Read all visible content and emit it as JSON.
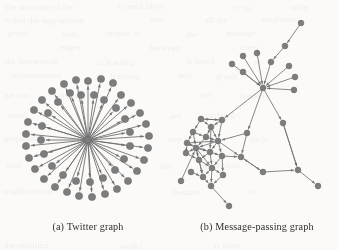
{
  "figure": {
    "kind": "two-panel-graph-figure",
    "background_color": "#fbfaf8",
    "node_color": "#7d7d7d",
    "node_stroke_color": "#6a6a6a",
    "edge_color": "#6f6f6f",
    "caption_color": "#2f2f2f",
    "panels": [
      {
        "id": "a",
        "caption": "(a) Twitter graph",
        "caption_center_x": 88,
        "caption_y": 221,
        "graph_type": "star",
        "directed": true,
        "node_radius": 3.6,
        "hub_radius": 3.2,
        "edge_width": 0.95,
        "arrowheads": true,
        "hub": {
          "id": "hub",
          "x": 88,
          "y": 140
        },
        "leaves": [
          {
            "id": "a1",
            "x": 88,
            "y": 81
          },
          {
            "id": "a2",
            "x": 101,
            "y": 79
          },
          {
            "id": "a3",
            "x": 113,
            "y": 83
          },
          {
            "id": "a4",
            "x": 76,
            "y": 80
          },
          {
            "id": "a5",
            "x": 64,
            "y": 84
          },
          {
            "id": "a6",
            "x": 52,
            "y": 91
          },
          {
            "id": "a7",
            "x": 42,
            "y": 100
          },
          {
            "id": "a8",
            "x": 34,
            "y": 110
          },
          {
            "id": "a9",
            "x": 28,
            "y": 122
          },
          {
            "id": "a10",
            "x": 26,
            "y": 134
          },
          {
            "id": "a11",
            "x": 26,
            "y": 146
          },
          {
            "id": "a12",
            "x": 29,
            "y": 158
          },
          {
            "id": "a13",
            "x": 35,
            "y": 169
          },
          {
            "id": "a14",
            "x": 44,
            "y": 179
          },
          {
            "id": "a15",
            "x": 55,
            "y": 187
          },
          {
            "id": "a16",
            "x": 67,
            "y": 192
          },
          {
            "id": "a17",
            "x": 79,
            "y": 196
          },
          {
            "id": "a18",
            "x": 92,
            "y": 197
          },
          {
            "id": "a19",
            "x": 105,
            "y": 194
          },
          {
            "id": "a20",
            "x": 117,
            "y": 189
          },
          {
            "id": "a21",
            "x": 128,
            "y": 181
          },
          {
            "id": "a22",
            "x": 137,
            "y": 171
          },
          {
            "id": "a23",
            "x": 144,
            "y": 160
          },
          {
            "id": "a24",
            "x": 148,
            "y": 148
          },
          {
            "id": "a25",
            "x": 149,
            "y": 136
          },
          {
            "id": "a26",
            "x": 146,
            "y": 124
          },
          {
            "id": "a27",
            "x": 140,
            "y": 113
          },
          {
            "id": "a28",
            "x": 131,
            "y": 103
          },
          {
            "id": "a29",
            "x": 121,
            "y": 95
          },
          {
            "id": "a30",
            "x": 70,
            "y": 93
          },
          {
            "id": "a31",
            "x": 58,
            "y": 102
          },
          {
            "id": "a32",
            "x": 48,
            "y": 113
          },
          {
            "id": "a33",
            "x": 42,
            "y": 126
          },
          {
            "id": "a34",
            "x": 41,
            "y": 140
          },
          {
            "id": "a35",
            "x": 44,
            "y": 154
          },
          {
            "id": "a36",
            "x": 52,
            "y": 166
          },
          {
            "id": "a37",
            "x": 63,
            "y": 175
          },
          {
            "id": "a38",
            "x": 76,
            "y": 181
          },
          {
            "id": "a39",
            "x": 90,
            "y": 182
          },
          {
            "id": "a40",
            "x": 103,
            "y": 178
          },
          {
            "id": "a41",
            "x": 115,
            "y": 170
          },
          {
            "id": "a42",
            "x": 124,
            "y": 159
          },
          {
            "id": "a43",
            "x": 130,
            "y": 146
          },
          {
            "id": "a44",
            "x": 130,
            "y": 132
          },
          {
            "id": "a45",
            "x": 125,
            "y": 119
          },
          {
            "id": "a46",
            "x": 116,
            "y": 108
          },
          {
            "id": "a47",
            "x": 104,
            "y": 100
          },
          {
            "id": "a48",
            "x": 94,
            "y": 95
          },
          {
            "id": "a49",
            "x": 81,
            "y": 95
          }
        ]
      },
      {
        "id": "b",
        "caption": "(b) Message-passing graph",
        "caption_center_x": 256,
        "caption_y": 221,
        "graph_type": "network",
        "directed": true,
        "node_radius": 2.9,
        "edge_width": 0.9,
        "arrowheads": true,
        "nodes": [
          {
            "id": "b1",
            "x": 301,
            "y": 23
          },
          {
            "id": "b2",
            "x": 285,
            "y": 46
          },
          {
            "id": "b3",
            "x": 271,
            "y": 62
          },
          {
            "id": "b4",
            "x": 243,
            "y": 56
          },
          {
            "id": "b5",
            "x": 257,
            "y": 53
          },
          {
            "id": "b6",
            "x": 289,
            "y": 66
          },
          {
            "id": "b7",
            "x": 232,
            "y": 64
          },
          {
            "id": "b8",
            "x": 243,
            "y": 72
          },
          {
            "id": "b9",
            "x": 295,
            "y": 77
          },
          {
            "id": "b10",
            "x": 263,
            "y": 88
          },
          {
            "id": "b11",
            "x": 294,
            "y": 90
          },
          {
            "id": "b12",
            "x": 283,
            "y": 123
          },
          {
            "id": "b13",
            "x": 222,
            "y": 120
          },
          {
            "id": "b14",
            "x": 247,
            "y": 133
          },
          {
            "id": "b15",
            "x": 201,
            "y": 119
          },
          {
            "id": "b16",
            "x": 211,
            "y": 127
          },
          {
            "id": "b17",
            "x": 193,
            "y": 132
          },
          {
            "id": "b18",
            "x": 206,
            "y": 137
          },
          {
            "id": "b19",
            "x": 187,
            "y": 143
          },
          {
            "id": "b20",
            "x": 218,
            "y": 141
          },
          {
            "id": "b21",
            "x": 196,
            "y": 148
          },
          {
            "id": "b22",
            "x": 186,
            "y": 153
          },
          {
            "id": "b23",
            "x": 210,
            "y": 152
          },
          {
            "id": "b24",
            "x": 199,
            "y": 160
          },
          {
            "id": "b25",
            "x": 222,
            "y": 156
          },
          {
            "id": "b26",
            "x": 241,
            "y": 157
          },
          {
            "id": "b27",
            "x": 298,
            "y": 170
          },
          {
            "id": "b28",
            "x": 263,
            "y": 172
          },
          {
            "id": "b29",
            "x": 212,
            "y": 168
          },
          {
            "id": "b30",
            "x": 191,
            "y": 172
          },
          {
            "id": "b31",
            "x": 203,
            "y": 177
          },
          {
            "id": "b32",
            "x": 223,
            "y": 175
          },
          {
            "id": "b33",
            "x": 181,
            "y": 181
          },
          {
            "id": "b34",
            "x": 211,
            "y": 186
          },
          {
            "id": "b35",
            "x": 318,
            "y": 186
          },
          {
            "id": "b36",
            "x": 229,
            "y": 206
          }
        ],
        "edges": [
          [
            "b1",
            "b2"
          ],
          [
            "b2",
            "b3"
          ],
          [
            "b3",
            "b10"
          ],
          [
            "b4",
            "b10"
          ],
          [
            "b5",
            "b10"
          ],
          [
            "b6",
            "b10"
          ],
          [
            "b7",
            "b10"
          ],
          [
            "b8",
            "b10"
          ],
          [
            "b9",
            "b10"
          ],
          [
            "b11",
            "b10"
          ],
          [
            "b10",
            "b12"
          ],
          [
            "b10",
            "b14"
          ],
          [
            "b10",
            "b13"
          ],
          [
            "b12",
            "b27"
          ],
          [
            "b14",
            "b26"
          ],
          [
            "b14",
            "b20"
          ],
          [
            "b13",
            "b16"
          ],
          [
            "b13",
            "b20"
          ],
          [
            "b13",
            "b15"
          ],
          [
            "b15",
            "b16"
          ],
          [
            "b15",
            "b17"
          ],
          [
            "b16",
            "b18"
          ],
          [
            "b16",
            "b20"
          ],
          [
            "b17",
            "b18"
          ],
          [
            "b17",
            "b21"
          ],
          [
            "b18",
            "b20"
          ],
          [
            "b18",
            "b21"
          ],
          [
            "b19",
            "b20"
          ],
          [
            "b19",
            "b21"
          ],
          [
            "b19",
            "b23"
          ],
          [
            "b20",
            "b23"
          ],
          [
            "b20",
            "b25"
          ],
          [
            "b20",
            "b21"
          ],
          [
            "b21",
            "b22"
          ],
          [
            "b21",
            "b23"
          ],
          [
            "b21",
            "b24"
          ],
          [
            "b21",
            "b29"
          ],
          [
            "b22",
            "b24"
          ],
          [
            "b23",
            "b24"
          ],
          [
            "b23",
            "b25"
          ],
          [
            "b23",
            "b29"
          ],
          [
            "b24",
            "b29"
          ],
          [
            "b24",
            "b31"
          ],
          [
            "b25",
            "b26"
          ],
          [
            "b25",
            "b29"
          ],
          [
            "b26",
            "b28"
          ],
          [
            "b28",
            "b27"
          ],
          [
            "b27",
            "b35"
          ],
          [
            "b12",
            "b27"
          ],
          [
            "b29",
            "b31"
          ],
          [
            "b29",
            "b32"
          ],
          [
            "b29",
            "b34"
          ],
          [
            "b30",
            "b31"
          ],
          [
            "b31",
            "b34"
          ],
          [
            "b32",
            "b34"
          ],
          [
            "b33",
            "b21"
          ],
          [
            "b34",
            "b36"
          ],
          [
            "b25",
            "b32"
          ],
          [
            "b20",
            "b26"
          ],
          [
            "b21",
            "b31"
          ],
          [
            "b16",
            "b23"
          ],
          [
            "b15",
            "b13"
          ],
          [
            "b22",
            "b19"
          ],
          [
            "b17",
            "b19"
          ],
          [
            "b28",
            "b26"
          ]
        ]
      }
    ]
  },
  "bleed_text": [
    {
      "text": "the structure of the",
      "x": 6,
      "y": 2,
      "size": 9
    },
    {
      "text": "in each layer",
      "x": 118,
      "y": 1,
      "size": 9
    },
    {
      "text": "of the",
      "x": 232,
      "y": 3,
      "size": 9
    },
    {
      "text": "node",
      "x": 290,
      "y": 2,
      "size": 9
    },
    {
      "text": "is that the aggregation",
      "x": 4,
      "y": 15,
      "size": 9
    },
    {
      "text": "over",
      "x": 150,
      "y": 14,
      "size": 9
    },
    {
      "text": "all the",
      "x": 205,
      "y": 15,
      "size": 9
    },
    {
      "text": "neighbors",
      "x": 262,
      "y": 14,
      "size": 9
    },
    {
      "text": "graph",
      "x": 8,
      "y": 28,
      "size": 9
    },
    {
      "text": "with",
      "x": 62,
      "y": 29,
      "size": 9
    },
    {
      "text": "respect to",
      "x": 106,
      "y": 28,
      "size": 9
    },
    {
      "text": "the",
      "x": 186,
      "y": 29,
      "size": 9
    },
    {
      "text": "message",
      "x": 226,
      "y": 28,
      "size": 9
    },
    {
      "text": "edges",
      "x": 60,
      "y": 42,
      "size": 9
    },
    {
      "text": "between",
      "x": 150,
      "y": 43,
      "size": 9
    },
    {
      "text": "users",
      "x": 240,
      "y": 42,
      "size": 9
    },
    {
      "text": "the framework",
      "x": 5,
      "y": 56,
      "size": 9
    },
    {
      "text": "of learning",
      "x": 96,
      "y": 57,
      "size": 9
    },
    {
      "text": "is based",
      "x": 186,
      "y": 56,
      "size": 9
    },
    {
      "text": "on",
      "x": 252,
      "y": 57,
      "size": 9
    },
    {
      "text": "representation",
      "x": 10,
      "y": 70,
      "size": 9
    },
    {
      "text": "learning",
      "x": 110,
      "y": 71,
      "size": 9
    },
    {
      "text": "and",
      "x": 178,
      "y": 70,
      "size": 9
    },
    {
      "text": "graph",
      "x": 216,
      "y": 71,
      "size": 9
    },
    {
      "text": "we can",
      "x": 4,
      "y": 90,
      "size": 9
    },
    {
      "text": "observe that",
      "x": 58,
      "y": 91,
      "size": 9
    },
    {
      "text": "the",
      "x": 200,
      "y": 90,
      "size": 9
    },
    {
      "text": "hidden",
      "x": 240,
      "y": 91,
      "size": 9
    },
    {
      "text": "states",
      "x": 8,
      "y": 110,
      "size": 9
    },
    {
      "text": "are",
      "x": 170,
      "y": 111,
      "size": 9
    },
    {
      "text": "updated",
      "x": 206,
      "y": 110,
      "size": 9
    },
    {
      "text": "propagation",
      "x": 4,
      "y": 133,
      "size": 9
    },
    {
      "text": "step",
      "x": 168,
      "y": 134,
      "size": 9
    },
    {
      "text": "for",
      "x": 210,
      "y": 133,
      "size": 9
    },
    {
      "text": "each",
      "x": 250,
      "y": 134,
      "size": 9
    },
    {
      "text": "with",
      "x": 6,
      "y": 160,
      "size": 9
    },
    {
      "text": "the",
      "x": 160,
      "y": 161,
      "size": 9
    },
    {
      "text": "aggregated",
      "x": 200,
      "y": 160,
      "size": 9
    },
    {
      "text": "neighborhood",
      "x": 2,
      "y": 186,
      "size": 9
    },
    {
      "text": "features",
      "x": 172,
      "y": 187,
      "size": 9
    },
    {
      "text": "of",
      "x": 248,
      "y": 186,
      "size": 9
    },
    {
      "text": "the resulting",
      "x": 4,
      "y": 240,
      "size": 9
    },
    {
      "text": "model",
      "x": 120,
      "y": 241,
      "size": 9
    },
    {
      "text": "is more",
      "x": 214,
      "y": 240,
      "size": 9
    }
  ]
}
